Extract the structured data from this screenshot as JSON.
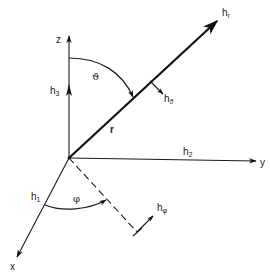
{
  "diagram": {
    "axes": {
      "x": {
        "label": "x",
        "unit_vector": "h",
        "unit_sub": "1"
      },
      "y": {
        "label": "y",
        "unit_vector": "h",
        "unit_sub": "2"
      },
      "z": {
        "label": "z",
        "unit_vector": "h",
        "unit_sub": "3"
      }
    },
    "radial": {
      "label": "r",
      "unit_vector": "h",
      "unit_sub": "r"
    },
    "angles": {
      "theta": {
        "label": "ϑ",
        "unit_vector": "h",
        "unit_sub": "ϑ"
      },
      "phi": {
        "label": "φ",
        "unit_vector": "h",
        "unit_sub": "φ"
      }
    },
    "colors": {
      "ink": "#1a1a1a",
      "background": "#ffffff"
    }
  }
}
